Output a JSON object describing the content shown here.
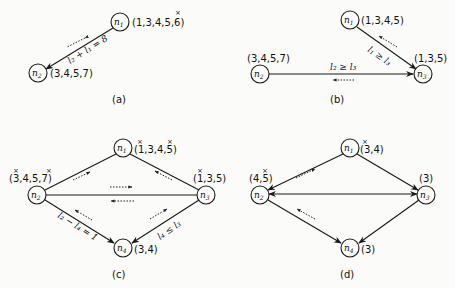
{
  "panels": {
    "a": {
      "caption": "(a)",
      "nodes": {
        "n1": {
          "label": "n",
          "sub": "1",
          "set": "(1,3,4,5,6)"
        },
        "n2": {
          "label": "n",
          "sub": "2",
          "set": "(3,4,5,7)"
        }
      },
      "edge_label": "l₂ + l₁ = 8"
    },
    "b": {
      "caption": "(b)",
      "nodes": {
        "n1": {
          "label": "n",
          "sub": "1",
          "set": "(1,3,4,5)"
        },
        "n2": {
          "label": "n",
          "sub": "2",
          "set": "(3,4,5,7)"
        },
        "n3": {
          "label": "n",
          "sub": "3",
          "set": "(1,3,5)"
        }
      },
      "edge_label_13": "l₁ ≥ l₃",
      "edge_label_23": "l₂ ≥ l₃"
    },
    "c": {
      "caption": "(c)",
      "nodes": {
        "n1": {
          "label": "n",
          "sub": "1",
          "set": "(1,3,4,5)"
        },
        "n2": {
          "label": "n",
          "sub": "2",
          "set": "(3,4,5,7)"
        },
        "n3": {
          "label": "n",
          "sub": "3",
          "set": "(1,3,5)"
        },
        "n4": {
          "label": "n",
          "sub": "4",
          "set": "(3,4)"
        }
      },
      "edge_label_24": "l₂ − l₄ = 1",
      "edge_label_34": "l₄ ≤ l₃"
    },
    "d": {
      "caption": "(d)",
      "nodes": {
        "n1": {
          "label": "n",
          "sub": "1",
          "set": "(3,4)"
        },
        "n2": {
          "label": "n",
          "sub": "2",
          "set": "(4,5)"
        },
        "n3": {
          "label": "n",
          "sub": "3",
          "set": "(3)"
        },
        "n4": {
          "label": "n",
          "sub": "4",
          "set": "(3)"
        }
      }
    }
  },
  "marks": {
    "x": "×"
  }
}
